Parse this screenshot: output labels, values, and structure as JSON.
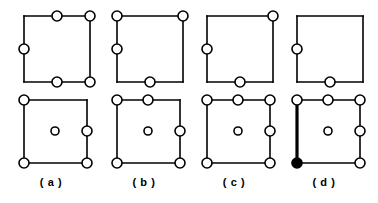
{
  "figure": {
    "type": "diagram",
    "background_color": "#ffffff",
    "stroke_color": "#000000",
    "node_fill_color": "#ffffff",
    "node_filled_color": "#000000",
    "edge_width": 1.6,
    "bold_edge_width": 3.2,
    "node_radius": 5,
    "center_node_radius": 4,
    "rows": 2,
    "columns": 4
  },
  "panels": [
    {
      "id": "panel-a",
      "label": "( a )",
      "label_text": "( a )",
      "column_x": 4,
      "top_diagram": {
        "id": "diagram-a-top",
        "square": {
          "x": 20,
          "y": 12,
          "size": 66
        },
        "bold_edges": [],
        "nodes": [
          {
            "name": "top-left",
            "cx": 20,
            "cy": 12,
            "r": 5,
            "filled": false,
            "present": false
          },
          {
            "name": "top-middle",
            "cx": 53,
            "cy": 12,
            "r": 5,
            "filled": false,
            "present": true
          },
          {
            "name": "top-right",
            "cx": 86,
            "cy": 12,
            "r": 5,
            "filled": false,
            "present": true
          },
          {
            "name": "left-middle",
            "cx": 20,
            "cy": 45,
            "r": 5,
            "filled": false,
            "present": true
          },
          {
            "name": "right-middle",
            "cx": 86,
            "cy": 45,
            "r": 5,
            "filled": false,
            "present": false
          },
          {
            "name": "bottom-left",
            "cx": 20,
            "cy": 78,
            "r": 5,
            "filled": false,
            "present": false
          },
          {
            "name": "bottom-middle",
            "cx": 53,
            "cy": 78,
            "r": 5,
            "filled": false,
            "present": true
          },
          {
            "name": "bottom-right",
            "cx": 86,
            "cy": 78,
            "r": 5,
            "filled": false,
            "present": true
          },
          {
            "name": "center",
            "cx": 53,
            "cy": 45,
            "r": 4,
            "filled": false,
            "present": false
          }
        ]
      },
      "bottom_diagram": {
        "id": "diagram-a-bottom",
        "square": {
          "x": 20,
          "y": 10,
          "size": 63
        },
        "bold_edges": [],
        "nodes": [
          {
            "name": "top-left",
            "cx": 20,
            "cy": 10,
            "r": 5,
            "filled": false,
            "present": true
          },
          {
            "name": "top-middle",
            "cx": 51,
            "cy": 10,
            "r": 5,
            "filled": false,
            "present": false
          },
          {
            "name": "top-right",
            "cx": 83,
            "cy": 10,
            "r": 5,
            "filled": false,
            "present": false
          },
          {
            "name": "left-middle",
            "cx": 20,
            "cy": 41,
            "r": 5,
            "filled": false,
            "present": false
          },
          {
            "name": "right-middle",
            "cx": 83,
            "cy": 41,
            "r": 5,
            "filled": false,
            "present": true
          },
          {
            "name": "bottom-left",
            "cx": 20,
            "cy": 73,
            "r": 5,
            "filled": false,
            "present": true
          },
          {
            "name": "bottom-middle",
            "cx": 51,
            "cy": 73,
            "r": 5,
            "filled": false,
            "present": false
          },
          {
            "name": "bottom-right",
            "cx": 83,
            "cy": 73,
            "r": 5,
            "filled": false,
            "present": true
          },
          {
            "name": "center",
            "cx": 51,
            "cy": 41,
            "r": 4,
            "filled": false,
            "present": true
          }
        ]
      }
    },
    {
      "id": "panel-b",
      "label": "( b )",
      "label_text": "( b )",
      "column_x": 97,
      "top_diagram": {
        "id": "diagram-b-top",
        "square": {
          "x": 20,
          "y": 12,
          "size": 66
        },
        "bold_edges": [],
        "nodes": [
          {
            "name": "top-left",
            "cx": 20,
            "cy": 12,
            "r": 5,
            "filled": false,
            "present": true
          },
          {
            "name": "top-middle",
            "cx": 53,
            "cy": 12,
            "r": 5,
            "filled": false,
            "present": false
          },
          {
            "name": "top-right",
            "cx": 86,
            "cy": 12,
            "r": 5,
            "filled": false,
            "present": true
          },
          {
            "name": "left-middle",
            "cx": 20,
            "cy": 45,
            "r": 5,
            "filled": false,
            "present": true
          },
          {
            "name": "right-middle",
            "cx": 86,
            "cy": 45,
            "r": 5,
            "filled": false,
            "present": false
          },
          {
            "name": "bottom-left",
            "cx": 20,
            "cy": 78,
            "r": 5,
            "filled": false,
            "present": false
          },
          {
            "name": "bottom-middle",
            "cx": 53,
            "cy": 78,
            "r": 5,
            "filled": false,
            "present": true
          },
          {
            "name": "bottom-right",
            "cx": 86,
            "cy": 78,
            "r": 5,
            "filled": false,
            "present": false
          },
          {
            "name": "center",
            "cx": 53,
            "cy": 45,
            "r": 4,
            "filled": false,
            "present": false
          }
        ]
      },
      "bottom_diagram": {
        "id": "diagram-b-bottom",
        "square": {
          "x": 20,
          "y": 10,
          "size": 63
        },
        "bold_edges": [],
        "nodes": [
          {
            "name": "top-left",
            "cx": 20,
            "cy": 10,
            "r": 5,
            "filled": false,
            "present": true
          },
          {
            "name": "top-middle",
            "cx": 51,
            "cy": 10,
            "r": 5,
            "filled": false,
            "present": true
          },
          {
            "name": "top-right",
            "cx": 83,
            "cy": 10,
            "r": 5,
            "filled": false,
            "present": false
          },
          {
            "name": "left-middle",
            "cx": 20,
            "cy": 41,
            "r": 5,
            "filled": false,
            "present": false
          },
          {
            "name": "right-middle",
            "cx": 83,
            "cy": 41,
            "r": 5,
            "filled": false,
            "present": true
          },
          {
            "name": "bottom-left",
            "cx": 20,
            "cy": 73,
            "r": 5,
            "filled": false,
            "present": true
          },
          {
            "name": "bottom-middle",
            "cx": 51,
            "cy": 73,
            "r": 5,
            "filled": false,
            "present": false
          },
          {
            "name": "bottom-right",
            "cx": 83,
            "cy": 73,
            "r": 5,
            "filled": false,
            "present": true
          },
          {
            "name": "center",
            "cx": 51,
            "cy": 41,
            "r": 4,
            "filled": false,
            "present": true
          }
        ]
      }
    },
    {
      "id": "panel-c",
      "label": "( c )",
      "label_text": "( c )",
      "column_x": 187,
      "top_diagram": {
        "id": "diagram-c-top",
        "square": {
          "x": 20,
          "y": 12,
          "size": 66
        },
        "bold_edges": [],
        "nodes": [
          {
            "name": "top-left",
            "cx": 20,
            "cy": 12,
            "r": 5,
            "filled": false,
            "present": false
          },
          {
            "name": "top-middle",
            "cx": 53,
            "cy": 12,
            "r": 5,
            "filled": false,
            "present": false
          },
          {
            "name": "top-right",
            "cx": 86,
            "cy": 12,
            "r": 5,
            "filled": false,
            "present": true
          },
          {
            "name": "left-middle",
            "cx": 20,
            "cy": 45,
            "r": 5,
            "filled": false,
            "present": true
          },
          {
            "name": "right-middle",
            "cx": 86,
            "cy": 45,
            "r": 5,
            "filled": false,
            "present": false
          },
          {
            "name": "bottom-left",
            "cx": 20,
            "cy": 78,
            "r": 5,
            "filled": false,
            "present": false
          },
          {
            "name": "bottom-middle",
            "cx": 53,
            "cy": 78,
            "r": 5,
            "filled": false,
            "present": true
          },
          {
            "name": "bottom-right",
            "cx": 86,
            "cy": 78,
            "r": 5,
            "filled": false,
            "present": false
          },
          {
            "name": "center",
            "cx": 53,
            "cy": 45,
            "r": 4,
            "filled": false,
            "present": false
          }
        ]
      },
      "bottom_diagram": {
        "id": "diagram-c-bottom",
        "square": {
          "x": 20,
          "y": 10,
          "size": 63
        },
        "bold_edges": [],
        "nodes": [
          {
            "name": "top-left",
            "cx": 20,
            "cy": 10,
            "r": 5,
            "filled": false,
            "present": true
          },
          {
            "name": "top-middle",
            "cx": 51,
            "cy": 10,
            "r": 5,
            "filled": false,
            "present": true
          },
          {
            "name": "top-right",
            "cx": 83,
            "cy": 10,
            "r": 5,
            "filled": false,
            "present": true
          },
          {
            "name": "left-middle",
            "cx": 20,
            "cy": 41,
            "r": 5,
            "filled": false,
            "present": false
          },
          {
            "name": "right-middle",
            "cx": 83,
            "cy": 41,
            "r": 5,
            "filled": false,
            "present": true
          },
          {
            "name": "bottom-left",
            "cx": 20,
            "cy": 73,
            "r": 5,
            "filled": false,
            "present": true
          },
          {
            "name": "bottom-middle",
            "cx": 51,
            "cy": 73,
            "r": 5,
            "filled": false,
            "present": false
          },
          {
            "name": "bottom-right",
            "cx": 83,
            "cy": 73,
            "r": 5,
            "filled": false,
            "present": true
          },
          {
            "name": "center",
            "cx": 51,
            "cy": 41,
            "r": 4,
            "filled": false,
            "present": true
          }
        ]
      }
    },
    {
      "id": "panel-d",
      "label": "( d )",
      "label_text": "( d )",
      "column_x": 277,
      "top_diagram": {
        "id": "diagram-d-top",
        "square": {
          "x": 20,
          "y": 12,
          "size": 66
        },
        "bold_edges": [],
        "nodes": [
          {
            "name": "top-left",
            "cx": 20,
            "cy": 12,
            "r": 5,
            "filled": false,
            "present": false
          },
          {
            "name": "top-middle",
            "cx": 53,
            "cy": 12,
            "r": 5,
            "filled": false,
            "present": false
          },
          {
            "name": "top-right",
            "cx": 86,
            "cy": 12,
            "r": 5,
            "filled": false,
            "present": false
          },
          {
            "name": "left-middle",
            "cx": 20,
            "cy": 45,
            "r": 5,
            "filled": false,
            "present": true
          },
          {
            "name": "right-middle",
            "cx": 86,
            "cy": 45,
            "r": 5,
            "filled": false,
            "present": false
          },
          {
            "name": "bottom-left",
            "cx": 20,
            "cy": 78,
            "r": 5,
            "filled": false,
            "present": false
          },
          {
            "name": "bottom-middle",
            "cx": 53,
            "cy": 78,
            "r": 5,
            "filled": false,
            "present": true
          },
          {
            "name": "bottom-right",
            "cx": 86,
            "cy": 78,
            "r": 5,
            "filled": false,
            "present": false
          },
          {
            "name": "center",
            "cx": 53,
            "cy": 45,
            "r": 4,
            "filled": false,
            "present": false
          }
        ]
      },
      "bottom_diagram": {
        "id": "diagram-d-bottom",
        "square": {
          "x": 20,
          "y": 10,
          "size": 63
        },
        "bold_edges": [
          "left"
        ],
        "nodes": [
          {
            "name": "top-left",
            "cx": 20,
            "cy": 10,
            "r": 5,
            "filled": false,
            "present": true
          },
          {
            "name": "top-middle",
            "cx": 51,
            "cy": 10,
            "r": 5,
            "filled": false,
            "present": true
          },
          {
            "name": "top-right",
            "cx": 83,
            "cy": 10,
            "r": 5,
            "filled": false,
            "present": true
          },
          {
            "name": "left-middle",
            "cx": 20,
            "cy": 41,
            "r": 5,
            "filled": false,
            "present": false
          },
          {
            "name": "right-middle",
            "cx": 83,
            "cy": 41,
            "r": 5,
            "filled": false,
            "present": true
          },
          {
            "name": "bottom-left",
            "cx": 20,
            "cy": 73,
            "r": 5,
            "filled": true,
            "present": true
          },
          {
            "name": "bottom-middle",
            "cx": 51,
            "cy": 73,
            "r": 5,
            "filled": false,
            "present": false
          },
          {
            "name": "bottom-right",
            "cx": 83,
            "cy": 73,
            "r": 5,
            "filled": false,
            "present": true
          },
          {
            "name": "center",
            "cx": 51,
            "cy": 41,
            "r": 4,
            "filled": false,
            "present": true
          }
        ]
      }
    }
  ]
}
